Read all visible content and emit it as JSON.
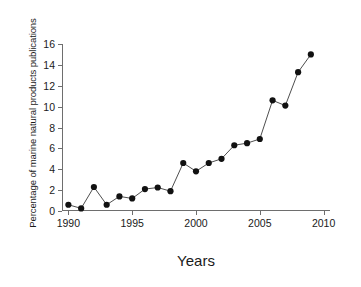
{
  "chart_data": {
    "type": "line",
    "title": "",
    "xlabel": "Years",
    "ylabel": "Percentage of marine natural products publications",
    "x": [
      1990,
      1991,
      1992,
      1993,
      1994,
      1995,
      1996,
      1997,
      1998,
      1999,
      2000,
      2001,
      2002,
      2003,
      2004,
      2005,
      2006,
      2007,
      2008,
      2009
    ],
    "values": [
      0.6,
      0.25,
      2.3,
      0.6,
      1.4,
      1.2,
      2.1,
      2.25,
      1.9,
      4.6,
      3.8,
      4.6,
      5.0,
      6.3,
      6.5,
      6.9,
      10.6,
      10.1,
      13.3,
      15.0
    ],
    "series": [
      {
        "name": "Percentage of marine natural products publications",
        "values": [
          0.6,
          0.25,
          2.3,
          0.6,
          1.4,
          1.2,
          2.1,
          2.25,
          1.9,
          4.6,
          3.8,
          4.6,
          5.0,
          6.3,
          6.5,
          6.9,
          10.6,
          10.1,
          13.3,
          15.0
        ]
      }
    ],
    "xlim": [
      1989.5,
      2010.5
    ],
    "ylim": [
      0,
      16
    ],
    "xticks": [
      1990,
      1995,
      2000,
      2005,
      2010
    ],
    "xtick_labels": [
      "1990",
      "1995",
      "2000",
      "2005",
      "2010"
    ],
    "yticks": [
      0,
      2,
      4,
      6,
      8,
      10,
      12,
      14,
      16
    ],
    "ytick_labels": [
      "0",
      "2",
      "4",
      "6",
      "8",
      "10",
      "12",
      "14",
      "16"
    ],
    "grid": false,
    "legend": false,
    "marker": "filled-circle",
    "marker_color": "#111111",
    "line_color": "#3a3a3a",
    "axis_color": "#6e6e6e",
    "background": "#ffffff"
  }
}
